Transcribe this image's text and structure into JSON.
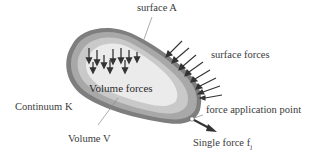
{
  "labels": {
    "surface": "surface A",
    "surface_forces": "surface forces",
    "volume_forces": "Volume forces",
    "continuum": "Continuum K",
    "force_point": "force application point",
    "volume": "Volume V",
    "single_force": "Single force f",
    "single_force_sub": "j"
  },
  "colors": {
    "outer": "#7a7a7a",
    "ring1": "#a6a6a6",
    "ring2": "#c8c8c8",
    "inner": "#e9e9e9",
    "arrow": "#3a3a3a",
    "leader": "#8a8a8a",
    "text": "#3a3a3a"
  },
  "elements": {
    "volume_force_arrows": 11,
    "surface_force_arrows": 8
  }
}
